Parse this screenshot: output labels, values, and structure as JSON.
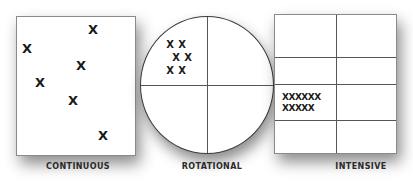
{
  "diagram": {
    "panels": [
      {
        "id": "continuous",
        "shape": "rectangle",
        "label": "CONTINUOUS",
        "marks": [
          {
            "text": "X",
            "x": 93,
            "y": 29
          },
          {
            "text": "X",
            "x": 27,
            "y": 48
          },
          {
            "text": "X",
            "x": 81,
            "y": 65
          },
          {
            "text": "X",
            "x": 40,
            "y": 82
          },
          {
            "text": "X",
            "x": 73,
            "y": 100
          },
          {
            "text": "X",
            "x": 103,
            "y": 135
          }
        ]
      },
      {
        "id": "rotational",
        "shape": "circle-quadrants",
        "label": "ROTATIONAL",
        "marks": [
          {
            "text": "X",
            "x": 170,
            "y": 45
          },
          {
            "text": "X",
            "x": 182,
            "y": 45
          },
          {
            "text": "X",
            "x": 176,
            "y": 58
          },
          {
            "text": "X",
            "x": 188,
            "y": 58
          },
          {
            "text": "X",
            "x": 170,
            "y": 71
          },
          {
            "text": "X",
            "x": 182,
            "y": 71
          }
        ]
      },
      {
        "id": "intensive",
        "shape": "grid-2x4",
        "label": "INTENSIVE",
        "marks": [
          {
            "text": "XXXXXX",
            "x": 282,
            "y": 97
          },
          {
            "text": "XXXXX",
            "x": 282,
            "y": 108
          }
        ]
      }
    ]
  }
}
